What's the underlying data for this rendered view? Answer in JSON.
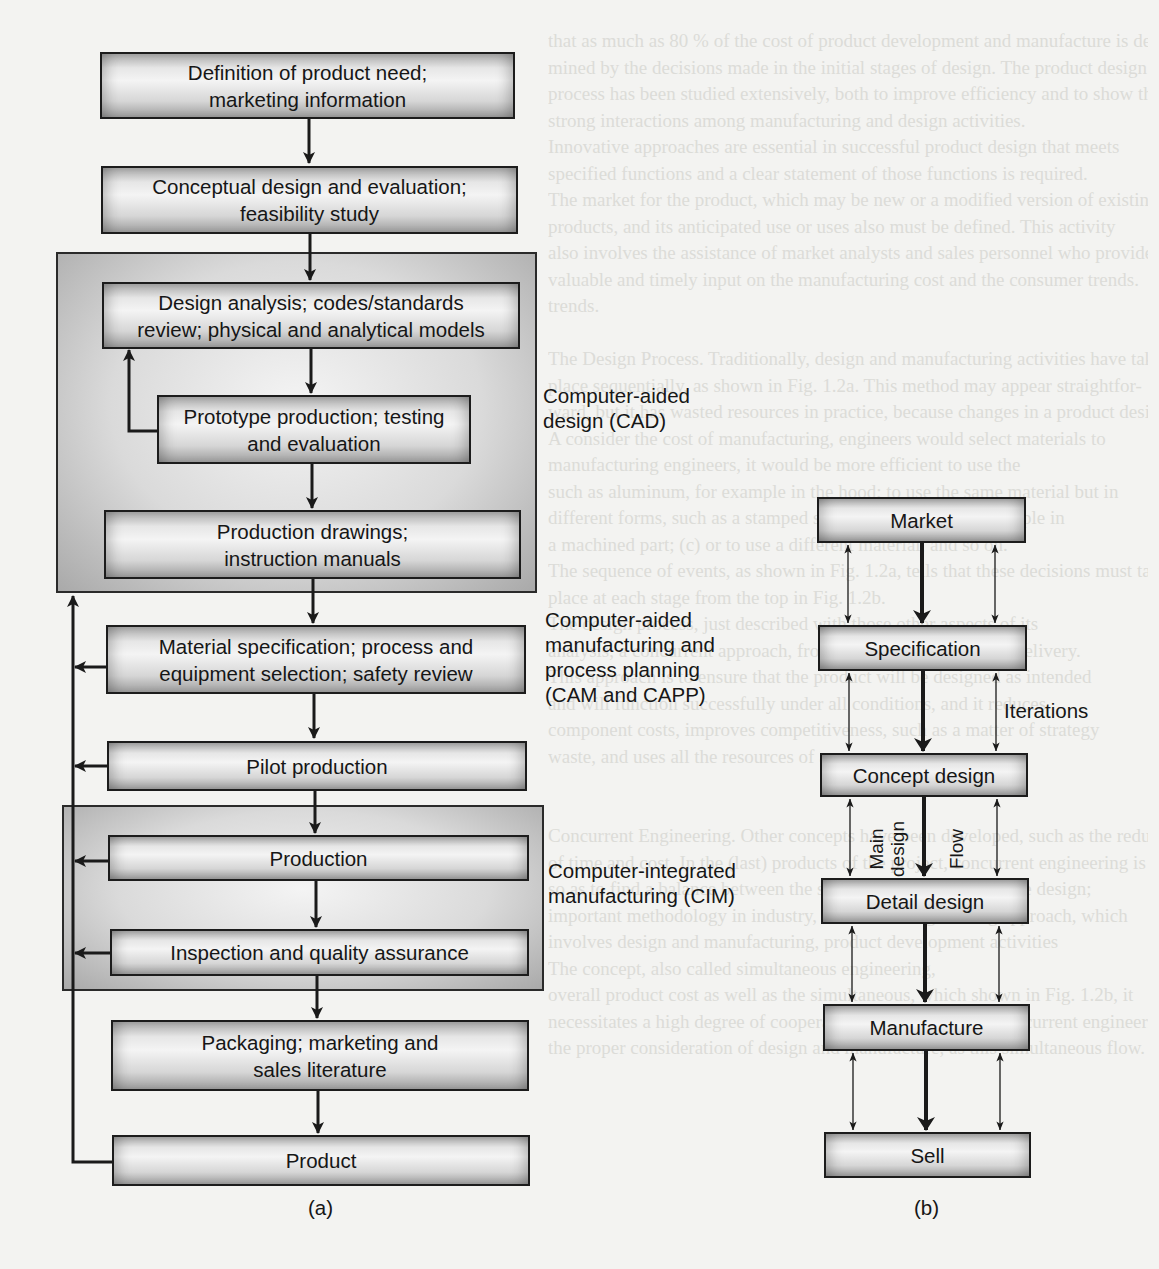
{
  "diagram_a": {
    "caption": "(a)",
    "steps": [
      {
        "id": "definition",
        "line1": "Definition of product need;",
        "line2": "marketing information"
      },
      {
        "id": "conceptual",
        "line1": "Conceptual design and evaluation;",
        "line2": "feasibility study"
      },
      {
        "id": "design-analysis",
        "line1": "Design analysis; codes/standards",
        "line2": "review; physical and analytical models"
      },
      {
        "id": "prototype",
        "line1": "Prototype production; testing",
        "line2": "and evaluation"
      },
      {
        "id": "production-drawings",
        "line1": "Production drawings;",
        "line2": "instruction manuals"
      },
      {
        "id": "material-spec",
        "line1": "Material specification; process and",
        "line2": "equipment selection; safety review"
      },
      {
        "id": "pilot",
        "line1": "Pilot production"
      },
      {
        "id": "production",
        "line1": "Production"
      },
      {
        "id": "inspection",
        "line1": "Inspection and quality assurance"
      },
      {
        "id": "packaging",
        "line1": "Packaging; marketing and",
        "line2": "sales literature"
      },
      {
        "id": "product",
        "line1": "Product"
      }
    ],
    "groups": {
      "cad": {
        "line1": "Computer-aided",
        "line2": "design (CAD)"
      },
      "cam": {
        "line1": "Computer-aided",
        "line2": "manufacturing and",
        "line3": "process planning",
        "line4": "(CAM and CAPP)"
      },
      "cim": {
        "line1": "Computer-integrated",
        "line2": "manufacturing (CIM)"
      }
    }
  },
  "diagram_b": {
    "caption": "(b)",
    "steps": [
      "Market",
      "Specification",
      "Concept design",
      "Detail design",
      "Manufacture",
      "Sell"
    ],
    "iterations_label": "Iterations",
    "main_design_label_1": "Main",
    "main_design_label_2": "design",
    "flow_label": "Flow"
  },
  "background_bleed": [
    "that as much as 80 % of the cost of product development and manufacture is deter-",
    "mined by the decisions made in the initial stages of design. The product design",
    "process has been studied extensively, both to improve efficiency and to show the",
    "strong interactions among manufacturing and design activities.",
    "Innovative approaches are essential in successful product design that meets",
    "specified functions and a clear statement of those functions is required.",
    "The market for the product, which may be new or a modified version of existing",
    "products, and its anticipated use or uses also must be defined. This activity",
    "also involves the assistance of market analysts and sales personnel who provide",
    "valuable and timely input on the manufacturing cost and the consumer trends.",
    "trends.",
    "",
    "The Design Process.  Traditionally, design and manufacturing activities have taken",
    "place sequentially, as shown in Fig. 1.2a. This method may appear straightfor-",
    "ward, but it has wasted resources in practice, because changes in a product design",
    "A consider the cost of manufacturing, engineers would select materials to",
    "manufacturing engineers, it would be more efficient to use the",
    "such as aluminum, for example in the hood; to use the same material but in",
    "different forms, such as a stamped sheet or a casting, for example in",
    "a machined part; (c) or to use a different material, and so on.",
    "The sequence of events, as shown in Fig. 1.2a, tells that these decisions must take",
    "place at each stage from the top in Fig. 1.2b.",
    "The design process, just described with those other aspects of its",
    "analysis, a concurrent approach, from design to final product delivery.",
    "This approach is to ensure that the product will be designed as intended",
    "and will function successfully under all conditions, and it reduces",
    "component costs, improves competitiveness, such as a matter of strategy",
    "waste, and uses all the resources of a company.",
    "",
    "",
    "Concurrent Engineering.  Other concepts have been developed, such as the reduction",
    "of time and cost. In the (last) products of the project, concurrent engineering is",
    "so as to find a balance between the shape of the product and the design;",
    "important methodology in industry, concurrent engineering approach, which",
    "involves design and manufacturing, product development activities",
    "The concept, also called simultaneous engineering,",
    "overall product cost as well as the simultaneous, which shown in Fig. 1.2b, it",
    "necessitates a high degree of cooperation. First, the role of concurrent engineering",
    "the proper consideration of design and manufacture, as this simultaneous flow."
  ]
}
